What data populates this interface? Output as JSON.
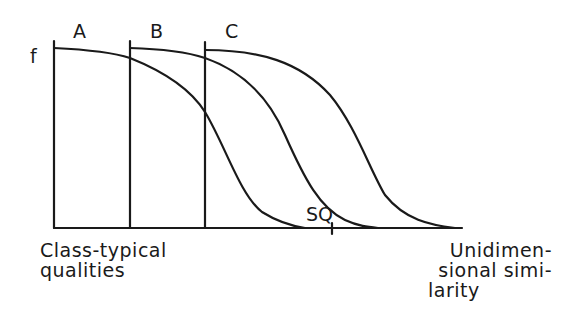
{
  "diagram": {
    "y_axis_label": "f",
    "curve_labels": [
      "A",
      "B",
      "C"
    ],
    "marker_label": "SQ",
    "x_axis_left_label": [
      "Class-typical",
      "qualities"
    ],
    "x_axis_right_label": [
      "Unidimen-",
      "sional simi-",
      "larity"
    ]
  },
  "style": {
    "line_color": "#1a1a1a",
    "background": "#ffffff"
  }
}
